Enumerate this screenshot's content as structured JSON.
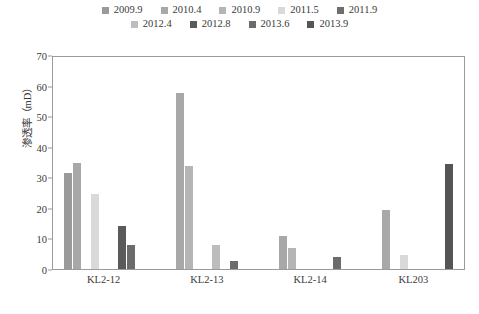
{
  "chart_data": {
    "type": "bar",
    "title": "",
    "xlabel": "",
    "ylabel": "渗透率（mD）",
    "ylim": [
      0,
      70
    ],
    "ytick_step": 10,
    "yticks": [
      "70",
      "60",
      "50",
      "40",
      "30",
      "20",
      "10",
      "0"
    ],
    "grid": false,
    "legend_position": "top",
    "categories": [
      "KL2-12",
      "KL2-13",
      "KL2-14",
      "KL203"
    ],
    "series": [
      {
        "name": "2009.9",
        "color": "#9a9a9a",
        "values": [
          31.5,
          0,
          0,
          0
        ]
      },
      {
        "name": "2010.4",
        "color": "#a8a8a8",
        "values": [
          35.0,
          58.0,
          11.0,
          19.5
        ]
      },
      {
        "name": "2010.9",
        "color": "#b5b5b5",
        "values": [
          0,
          34.0,
          7.0,
          0
        ]
      },
      {
        "name": "2011.5",
        "color": "#d9d9d9",
        "values": [
          24.5,
          0,
          0,
          4.5
        ]
      },
      {
        "name": "2011.9",
        "color": "#6e6e6e",
        "values": [
          0,
          0,
          0,
          0
        ]
      },
      {
        "name": "2012.4",
        "color": "#bdbdbd",
        "values": [
          0,
          8.0,
          0,
          0
        ]
      },
      {
        "name": "2012.8",
        "color": "#5a5a5a",
        "values": [
          14.0,
          0,
          0,
          0
        ]
      },
      {
        "name": "2013.6",
        "color": "#6b6b6b",
        "values": [
          8.0,
          2.5,
          4.0,
          0
        ]
      },
      {
        "name": "2013.9",
        "color": "#555555",
        "values": [
          0,
          0,
          0,
          34.5
        ]
      }
    ]
  },
  "legend": {
    "row1": [
      "2009.9",
      "2010.4",
      "2010.9",
      "2011.5",
      "2011.9"
    ],
    "row2": [
      "2012.4",
      "2012.8",
      "2013.6",
      "2013.9"
    ]
  }
}
